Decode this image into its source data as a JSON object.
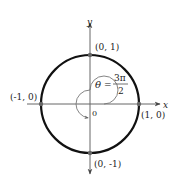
{
  "diagram": {
    "axes": {
      "x_label": "x",
      "y_label": "y",
      "origin_label": "0"
    },
    "points": [
      {
        "label": "(0, 1)"
      },
      {
        "label": "(-1, 0)"
      },
      {
        "label": "(1, 0)"
      },
      {
        "label": "(0, -1)"
      }
    ],
    "angle": {
      "symbol": "θ",
      "equals": "=",
      "numerator": "3π",
      "denominator": "2"
    },
    "colors": {
      "circle": "#111111",
      "axes": "#555555",
      "arc": "#777777",
      "points": "#666666"
    }
  }
}
